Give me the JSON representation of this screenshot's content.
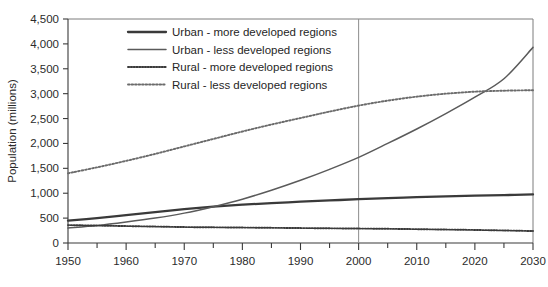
{
  "chart_data": {
    "type": "line",
    "title": "",
    "xlabel": "",
    "ylabel": "Population (millions)",
    "xlim": [
      1950,
      2030
    ],
    "ylim": [
      0,
      4500
    ],
    "grid": false,
    "legend_position": "top-center-inside",
    "x": [
      1950,
      1955,
      1960,
      1965,
      1970,
      1975,
      1980,
      1985,
      1990,
      1995,
      2000,
      2005,
      2010,
      2015,
      2020,
      2025,
      2030
    ],
    "x_tick_labels": [
      "1950",
      "1960",
      "1970",
      "1980",
      "1990",
      "2000",
      "2010",
      "2020",
      "2030"
    ],
    "x_major_ticks": [
      1950,
      1960,
      1970,
      1980,
      1990,
      2000,
      2010,
      2020,
      2030
    ],
    "x_minor_ticks": [
      1955,
      1965,
      1975,
      1985,
      1995,
      2005,
      2015,
      2025
    ],
    "y_tick_labels": [
      "0",
      "500",
      "1,000",
      "1,500",
      "2,000",
      "2,500",
      "3,000",
      "3,500",
      "4,000",
      "4,500"
    ],
    "y_ticks": [
      0,
      500,
      1000,
      1500,
      2000,
      2500,
      3000,
      3500,
      4000,
      4500
    ],
    "annotations": [
      {
        "name": "year-2000-marker",
        "type": "vline",
        "x": 2000,
        "label": ""
      }
    ],
    "series": [
      {
        "name": "Urban - more developed regions",
        "style": "solid-thick",
        "color": "#3a3a3a",
        "values": [
          450,
          500,
          560,
          620,
          680,
          730,
          770,
          800,
          830,
          855,
          880,
          900,
          920,
          935,
          950,
          962,
          975
        ]
      },
      {
        "name": "Urban - less developed regions",
        "style": "solid-thin",
        "color": "#5a5a5a",
        "values": [
          300,
          350,
          420,
          500,
          600,
          730,
          880,
          1060,
          1260,
          1480,
          1720,
          2000,
          2290,
          2600,
          2930,
          3300,
          3930
        ]
      },
      {
        "name": "Rural - more developed regions",
        "style": "dotted-fine",
        "color": "#3a3a3a",
        "values": [
          360,
          350,
          340,
          330,
          320,
          315,
          310,
          305,
          300,
          295,
          290,
          285,
          278,
          270,
          262,
          252,
          240
        ]
      },
      {
        "name": "Rural - less developed regions",
        "style": "dotted-coarse",
        "color": "#6b6b6b",
        "values": [
          1400,
          1520,
          1650,
          1790,
          1940,
          2090,
          2240,
          2380,
          2510,
          2640,
          2760,
          2860,
          2940,
          3000,
          3040,
          3060,
          3070
        ]
      }
    ]
  },
  "legend": {
    "items": [
      {
        "label": "Urban - more developed regions",
        "style": "solid-thick"
      },
      {
        "label": "Urban - less developed regions",
        "style": "solid-thin"
      },
      {
        "label": "Rural - more developed regions",
        "style": "dotted-fine"
      },
      {
        "label": "Rural - less developed regions",
        "style": "dotted-coarse"
      }
    ]
  },
  "colors": {
    "axis": "#3a3a3a",
    "frame": "#7d7d7d",
    "text": "#262626",
    "background": "#ffffff",
    "marker": "#8c8c8c"
  }
}
